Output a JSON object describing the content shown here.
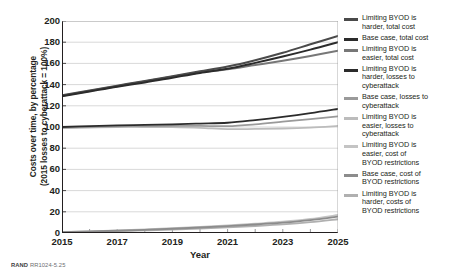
{
  "figure": {
    "credit_prefix": "RAND",
    "credit_id": "RR1024-5.25"
  },
  "chart_data": {
    "type": "line",
    "title": "",
    "xlabel": "Year",
    "ylabel": "Costs over time, by percentage (2015 losses to cyberattack = 100%)",
    "ylabel_line1": "Costs over time, by percentage",
    "ylabel_line2": "(2015 losses to cyberattack = 100%)",
    "xlim": [
      2015,
      2025
    ],
    "ylim": [
      0,
      200
    ],
    "ytick_values": [
      0,
      20,
      40,
      60,
      80,
      100,
      120,
      140,
      160,
      180,
      200
    ],
    "ytick_labels": [
      "0",
      "20",
      "40",
      "60",
      "80",
      "100",
      "120",
      "140",
      "160",
      "180",
      "200"
    ],
    "xtick_values": [
      2015,
      2017,
      2019,
      2021,
      2023,
      2025
    ],
    "xtick_labels": [
      "2015",
      "2017",
      "2019",
      "2021",
      "2023",
      "2025"
    ],
    "grid": "horizontal",
    "legend_position": "right",
    "x": [
      2015,
      2016,
      2017,
      2018,
      2019,
      2020,
      2021,
      2022,
      2023,
      2024,
      2025
    ],
    "series": [
      {
        "name": "Limiting BYOD is harder, total cost",
        "color": "#4a4a4a",
        "width": 2.0,
        "values": [
          130,
          134.5,
          139,
          143.5,
          148,
          152.5,
          157,
          163,
          170,
          178,
          186
        ]
      },
      {
        "name": "Base case, total cost",
        "color": "#2b2b2b",
        "width": 2.0,
        "values": [
          129,
          133.5,
          138,
          142,
          146.5,
          151,
          155,
          160.5,
          166.5,
          173,
          180
        ]
      },
      {
        "name": "Limiting BYOD is easier, total cost",
        "color": "#777777",
        "width": 2.0,
        "values": [
          129.5,
          134,
          138.5,
          143,
          147.5,
          151.5,
          154.5,
          158.5,
          162.5,
          167,
          172
        ]
      },
      {
        "name": "Limiting BYOD is harder, losses to cyberattack",
        "color": "#2b2b2b",
        "width": 1.8,
        "values": [
          100,
          100.8,
          101.6,
          102,
          102.5,
          103.2,
          104,
          106.5,
          109.5,
          113,
          117
        ]
      },
      {
        "name": "Base case, losses to cyberattack",
        "color": "#9a9a9a",
        "width": 1.8,
        "values": [
          99.5,
          100,
          100.6,
          100.8,
          101,
          101,
          100.8,
          102.5,
          105,
          107.5,
          110
        ]
      },
      {
        "name": "Limiting BYOD is easier, losses to cyberattack",
        "color": "#bcbcbc",
        "width": 1.8,
        "values": [
          99,
          99.5,
          100,
          100,
          99.8,
          99.2,
          98,
          98.2,
          98.6,
          99.5,
          101
        ]
      },
      {
        "name": "Limiting BYOD is easier, cost of BYOD restrictions",
        "color": "#c4c4c4",
        "width": 1.8,
        "values": [
          1,
          1.6,
          2.4,
          3.4,
          4.5,
          5.8,
          7.2,
          8.8,
          10.6,
          13.2,
          17
        ]
      },
      {
        "name": "Base case, cost of BYOD restrictions",
        "color": "#8c8c8c",
        "width": 1.8,
        "values": [
          0.9,
          1.4,
          2.1,
          3.0,
          4.0,
          5.2,
          6.5,
          8.0,
          9.8,
          12.2,
          15.5
        ]
      },
      {
        "name": "Limiting BYOD is harder, costs of BYOD restrictions",
        "color": "#b0b0b0",
        "width": 1.8,
        "values": [
          0.8,
          1.1,
          1.7,
          2.4,
          3.2,
          4.2,
          5.3,
          6.6,
          8.1,
          10.2,
          13
        ]
      }
    ]
  },
  "legend": {
    "items": [
      {
        "label_lines": [
          "Limiting BYOD is",
          "harder, total cost"
        ],
        "color": "#4a4a4a"
      },
      {
        "label_lines": [
          "Base case, total cost"
        ],
        "color": "#2b2b2b"
      },
      {
        "label_lines": [
          "Limiting BYOD is",
          "easier, total cost"
        ],
        "color": "#777777"
      },
      {
        "label_lines": [
          "Limiting BYOD is",
          "harder, losses to",
          "cyberattack"
        ],
        "color": "#2b2b2b"
      },
      {
        "label_lines": [
          "Base case, losses to",
          "cyberattack"
        ],
        "color": "#9a9a9a"
      },
      {
        "label_lines": [
          "Limiting BYOD is",
          "easier, losses to",
          "cyberattack"
        ],
        "color": "#bcbcbc"
      },
      {
        "label_lines": [
          "Limiting BYOD is",
          "easier, cost of",
          "BYOD restrictions"
        ],
        "color": "#c4c4c4"
      },
      {
        "label_lines": [
          "Base case, cost of",
          "BYOD restrictions"
        ],
        "color": "#8c8c8c"
      },
      {
        "label_lines": [
          "Limiting BYOD is",
          "harder, costs of",
          "BYOD restrictions"
        ],
        "color": "#b0b0b0"
      }
    ]
  }
}
